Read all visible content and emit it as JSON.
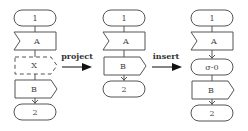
{
  "diagram": {
    "columns": [
      {
        "name": "original",
        "nodes": [
          {
            "type": "terminal",
            "label": "1"
          },
          {
            "type": "receive",
            "label": "A"
          },
          {
            "type": "send-dashed",
            "label": "X"
          },
          {
            "type": "send",
            "label": "B"
          },
          {
            "type": "terminal",
            "label": "2"
          }
        ]
      },
      {
        "name": "projected",
        "nodes": [
          {
            "type": "terminal",
            "label": "1"
          },
          {
            "type": "receive",
            "label": "A"
          },
          {
            "type": "send",
            "label": "B"
          },
          {
            "type": "terminal",
            "label": "2"
          }
        ]
      },
      {
        "name": "inserted",
        "nodes": [
          {
            "type": "terminal",
            "label": "1"
          },
          {
            "type": "receive",
            "label": "A"
          },
          {
            "type": "terminal",
            "label": "σ-0"
          },
          {
            "type": "send",
            "label": "B"
          },
          {
            "type": "terminal",
            "label": "2"
          }
        ]
      }
    ],
    "transitions": [
      {
        "label": "project"
      },
      {
        "label": "insert"
      }
    ]
  }
}
